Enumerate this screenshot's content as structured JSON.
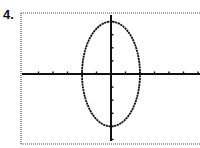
{
  "problem": {
    "label": "4."
  },
  "colors": {
    "frame": "#555555",
    "axis": "#111111",
    "curve": "#111111",
    "background": "#ffffff"
  },
  "chart_data": {
    "type": "line",
    "title": "",
    "xlabel": "",
    "ylabel": "",
    "equation": "x^2/4 + y^2/16 = 1",
    "center": [
      0,
      0
    ],
    "semi_axis_x": 2,
    "semi_axis_y": 4,
    "xlim": [
      -6,
      6
    ],
    "ylim": [
      -5,
      5
    ],
    "x_tick_step": 1,
    "y_tick_step": 1,
    "grid": false,
    "legend": "none",
    "series": [
      {
        "name": "ellipse",
        "x": [
          2,
          1.732,
          1,
          0,
          -1,
          -1.732,
          -2,
          -1.732,
          -1,
          0,
          1,
          1.732,
          2
        ],
        "y": [
          0,
          2,
          3.464,
          4,
          3.464,
          2,
          0,
          -2,
          -3.464,
          -4,
          -3.464,
          -2,
          0
        ]
      }
    ]
  }
}
